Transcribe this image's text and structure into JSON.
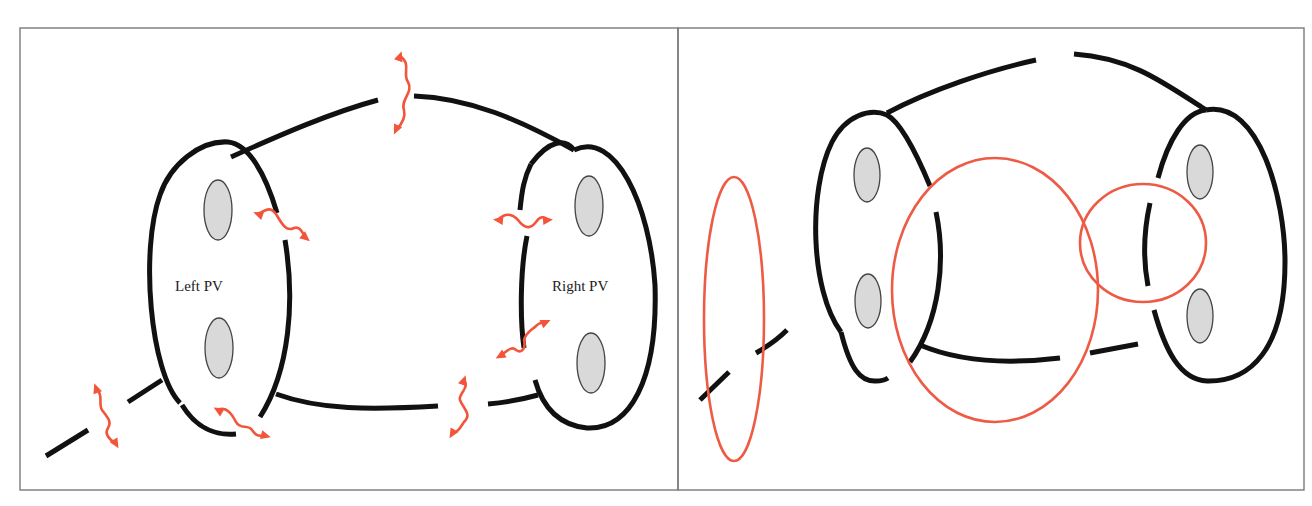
{
  "figure": {
    "colors": {
      "wall": "#111111",
      "vein_fill": "#d9d9d9",
      "vein_stroke": "#444444",
      "wave": "#f2553a",
      "gap_ring": "#ee5b45",
      "panel_border": "#7a7a7a"
    },
    "panels": [
      {
        "id": "left-panel",
        "border": {
          "x": 20,
          "y": 28,
          "w": 658,
          "h": 462
        },
        "labels": [
          {
            "id": "left-pv-label",
            "text": "Left PV",
            "x": 175,
            "y": 291
          },
          {
            "id": "right-pv-label",
            "text": "Right PV",
            "x": 552,
            "y": 291
          }
        ],
        "veins": [
          {
            "cx": 218,
            "cy": 210,
            "rx": 14,
            "ry": 30
          },
          {
            "cx": 219,
            "cy": 348,
            "rx": 14,
            "ry": 30
          },
          {
            "cx": 589,
            "cy": 206,
            "rx": 14,
            "ry": 30
          },
          {
            "cx": 591,
            "cy": 363,
            "rx": 14,
            "ry": 30
          }
        ],
        "walls": [
          "M 180 403 C 150 372 140 250 160 195 C 170 165 200 140 228 142 C 248 144 265 172 277 213",
          "M 182 405 C 196 428 216 436 236 434",
          "M 285 240 C 295 300 290 370 260 417",
          "M 231 157 C 280 135 330 113 378 100",
          "M 414 96 C 470 98 520 120 574 150",
          "M 574 150 C 615 130 650 205 655 285 C 658 380 630 430 587 428 C 557 425 542 405 535 380",
          "M 531 164 C 549 140 565 138 574 150",
          "M 531 164 C 524 178 522 190 520 210",
          "M 527 236 C 520 270 520 320 524 348",
          "M 276 394 C 320 410 370 410 438 406",
          "M 488 404 C 500 403 520 400 538 395",
          "M 162 380 L 128 402",
          "M 88 430 L 46 456"
        ],
        "waves": [
          {
            "d": "M 400 56 C 412 64 402 74 408 82 C 414 92 400 100 404 110 C 406 118 402 124 396 130",
            "heads": [
              [
                400,
                56,
                -70
              ],
              [
                396,
                130,
                115
              ]
            ]
          },
          {
            "d": "M 258 214 C 266 210 270 206 276 214 C 282 224 286 232 294 228 C 300 226 302 232 306 238",
            "heads": [
              [
                258,
                214,
                200
              ],
              [
                306,
                238,
                40
              ]
            ]
          },
          {
            "d": "M 498 220 C 506 212 512 214 518 220 C 524 228 530 230 536 222 C 540 216 544 216 548 220",
            "heads": [
              [
                498,
                220,
                185
              ],
              [
                548,
                220,
                -5
              ]
            ]
          },
          {
            "d": "M 500 356 C 508 350 512 346 516 350 C 522 354 526 348 524 340 C 526 332 532 330 536 326 C 540 322 544 322 546 322",
            "heads": [
              [
                500,
                356,
                150
              ],
              [
                546,
                322,
                -25
              ]
            ]
          },
          {
            "d": "M 218 410 C 226 406 232 414 236 422 C 240 430 248 424 252 430 C 256 436 258 436 266 436",
            "heads": [
              [
                218,
                410,
                210
              ],
              [
                266,
                436,
                15
              ]
            ]
          },
          {
            "d": "M 96 388 C 104 396 98 404 102 410 C 108 418 112 422 108 428 C 104 434 110 440 116 444",
            "heads": [
              [
                96,
                388,
                -110
              ],
              [
                116,
                444,
                60
              ]
            ]
          },
          {
            "d": "M 464 380 C 470 388 458 394 460 400 C 464 410 472 414 464 422 C 460 428 458 432 452 434",
            "heads": [
              [
                464,
                380,
                -70
              ],
              [
                452,
                434,
                120
              ]
            ]
          }
        ]
      },
      {
        "id": "right-panel",
        "border": {
          "x": 678,
          "y": 28,
          "w": 626,
          "h": 462
        },
        "veins": [
          {
            "cx": 867,
            "cy": 175,
            "rx": 13,
            "ry": 27
          },
          {
            "cx": 868,
            "cy": 301,
            "rx": 13,
            "ry": 27
          },
          {
            "cx": 1200,
            "cy": 172,
            "rx": 13,
            "ry": 27
          },
          {
            "cx": 1200,
            "cy": 316,
            "rx": 13,
            "ry": 27
          }
        ],
        "walls": [
          "M 841 332 C 810 290 808 190 832 142 C 846 115 870 108 887 115 C 900 122 915 150 930 186",
          "M 841 332 C 850 368 860 382 876 381 C 882 381 885 380 888 378",
          "M 936 212 C 946 260 940 320 910 362",
          "M 887 113 C 930 90 990 70 1036 60",
          "M 1074 54 C 1130 58 1160 80 1206 110",
          "M 1206 110 C 1260 100 1285 200 1285 262 C 1285 350 1250 382 1207 381 C 1180 380 1165 350 1154 310",
          "M 1158 178 C 1168 140 1185 112 1206 110",
          "M 1150 203 C 1144 230 1143 260 1148 286",
          "M 920 345 C 960 362 1010 364 1060 358",
          "M 1090 353 L 1138 344",
          "M 787 330 C 780 337 770 345 756 353",
          "M 729 372 L 700 400"
        ],
        "rings": [
          {
            "cx": 734,
            "cy": 319,
            "rx": 30,
            "ry": 142
          },
          {
            "cx": 995,
            "cy": 290,
            "rx": 103,
            "ry": 132
          },
          {
            "cx": 1143,
            "cy": 243,
            "rx": 63,
            "ry": 59
          }
        ]
      }
    ]
  }
}
